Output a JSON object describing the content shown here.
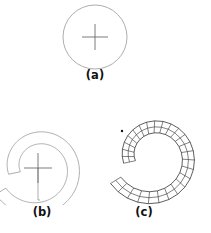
{
  "figure": {
    "background_color": "#ffffff",
    "line_color": "#8a8a8a",
    "mesh_color": "#2b2b2b",
    "caption_color": "#111111",
    "panels": [
      {
        "id": "a",
        "label": "(a)",
        "description": "circle outline with center crosshair",
        "center": {
          "x": 95,
          "y": 37
        },
        "radius": 32,
        "crosshair": {
          "x": 95,
          "y": 37,
          "half_width": 13,
          "half_height": 13
        }
      },
      {
        "id": "b",
        "label": "(b)",
        "description": "C-shaped spiral annulus outline with center crosshair",
        "center": {
          "x": 38,
          "y": 168
        },
        "inner_radius_start": 18,
        "outer_radius_start": 30,
        "inner_radius_end": 38,
        "outer_radius_end": 50,
        "sweep_degrees": 340,
        "crosshair": {
          "x": 38,
          "y": 168,
          "half_width": 14,
          "half_height": 15
        }
      },
      {
        "id": "c",
        "label": "(c)",
        "description": "spiral annulus discretized into quadrilateral mesh cells",
        "center": {
          "x": 153,
          "y": 157
        },
        "inner_radius_start": 18,
        "outer_radius_start": 30,
        "inner_radius_end": 38,
        "outer_radius_end": 50,
        "sweep_degrees": 340,
        "radial_divisions": 2,
        "angular_divisions": 26,
        "marker_dot": {
          "x": 122,
          "y": 131,
          "radius": 1.2
        }
      }
    ]
  },
  "captions": {
    "a": "(a)",
    "b": "(b)",
    "c": "(c)"
  }
}
